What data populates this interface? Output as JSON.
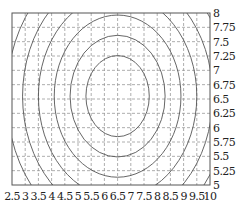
{
  "chart_data": {
    "type": "contour",
    "title": "",
    "xlabel": "",
    "ylabel": "",
    "xlim": [
      2.5,
      10
    ],
    "ylim": [
      5,
      8
    ],
    "grid": true,
    "grid_style": "dashed",
    "y_axis_position": "right",
    "x_ticks": [
      "2.5",
      "3",
      "3.5",
      "4",
      "4.5",
      "5",
      "5.5",
      "6",
      "6.5",
      "7",
      "7.5",
      "8",
      "8.5",
      "9",
      "9.5",
      "10"
    ],
    "y_ticks": [
      "5",
      "5.25",
      "5.5",
      "5.75",
      "6",
      "6.25",
      "6.5",
      "6.75",
      "7",
      "7.25",
      "7.5",
      "7.75",
      "8"
    ],
    "contours": {
      "shape": "concentric ellipses",
      "center": [
        6.5,
        6.55
      ],
      "count": 9,
      "x_radii": [
        1.2,
        1.8,
        2.4,
        3.0,
        3.6,
        4.2,
        4.8,
        5.4,
        6.0
      ]
    },
    "line_color": "#555555",
    "grid_color": "#999999"
  }
}
